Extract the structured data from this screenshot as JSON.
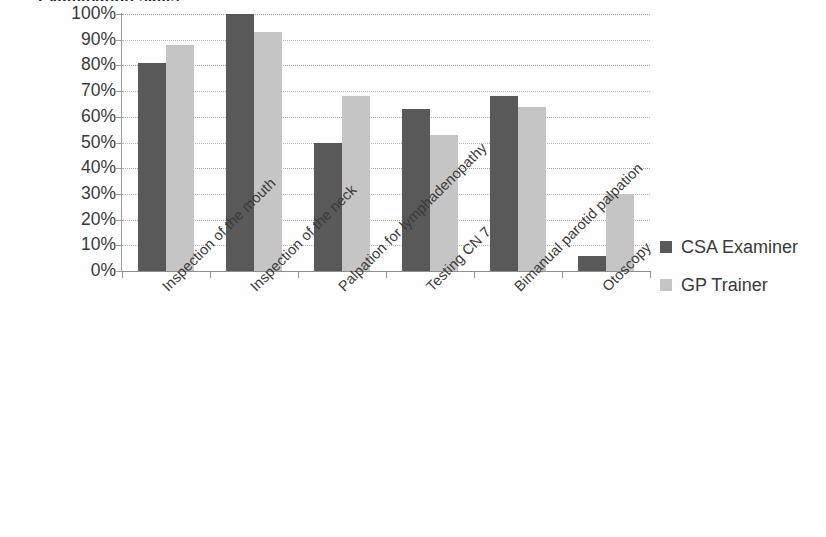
{
  "chart_data": {
    "type": "bar",
    "title": "Examination skills",
    "title_truncated": true,
    "categories": [
      "Inspection of the mouth",
      "Inspection of the neck",
      "Palpation for lymphadenopathy",
      "Testing CN 7",
      "Bimanual parotid palpation",
      "Otoscopy"
    ],
    "series": [
      {
        "name": "CSA Examiner",
        "color": "#595959",
        "values": [
          81,
          100,
          50,
          63,
          68,
          6
        ]
      },
      {
        "name": "GP Trainer",
        "color": "#c5c5c5",
        "values": [
          88,
          93,
          68,
          53,
          64,
          30
        ]
      }
    ],
    "xlabel": "",
    "ylabel": "",
    "ylim": [
      0,
      100
    ],
    "ytick_labels": [
      "100%",
      "90%",
      "80%",
      "70%",
      "60%",
      "50%",
      "40%",
      "30%",
      "20%",
      "10%",
      "0%"
    ],
    "ytick_values": [
      100,
      90,
      80,
      70,
      60,
      50,
      40,
      30,
      20,
      10,
      0
    ],
    "grid": true,
    "grid_axis": "y",
    "legend_position": "right",
    "value_suffix": "%",
    "category_label_rotation": -45
  },
  "legend": {
    "entries": [
      {
        "label": "CSA Examiner",
        "swatch": "csa"
      },
      {
        "label": "GP Trainer",
        "swatch": "gp"
      }
    ]
  }
}
